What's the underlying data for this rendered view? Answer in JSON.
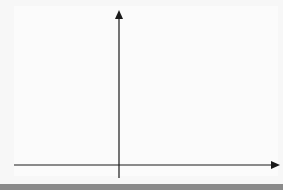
{
  "chart_data": {
    "type": "diagram",
    "title": "",
    "xlabel": "x",
    "ylabel": "y",
    "xlim": [
      -4,
      5.5
    ],
    "ylim": [
      -0.3,
      5.8
    ],
    "grid": true,
    "x_ticks": [
      "-3",
      "-2",
      "-1",
      "1",
      "2",
      "3",
      "4",
      "5"
    ],
    "y_ticks": [
      "1",
      "2",
      "3",
      "5"
    ],
    "origin_label": "0",
    "shapes": [
      {
        "name": "S",
        "label": "S",
        "vertices": [
          [
            -2,
            4
          ],
          [
            0,
            4
          ],
          [
            -1,
            3
          ],
          [
            -2,
            1
          ]
        ],
        "fill": "#b3b3b3",
        "stroke": "#222222"
      }
    ]
  },
  "axes": {
    "x_label": "x",
    "y_label": "y",
    "origin": "0",
    "x_tick_labels": [
      "-3",
      "-2",
      "-1",
      "1",
      "2",
      "3",
      "4",
      "5"
    ],
    "y_tick_labels": [
      "1",
      "2",
      "3",
      "5"
    ]
  },
  "shape": {
    "label": "S"
  },
  "colors": {
    "grid_major": "#c8c8c8",
    "grid_minor": "#e6e6e6",
    "axis": "#1a1a1a",
    "shape_fill": "#b3b3b3"
  }
}
